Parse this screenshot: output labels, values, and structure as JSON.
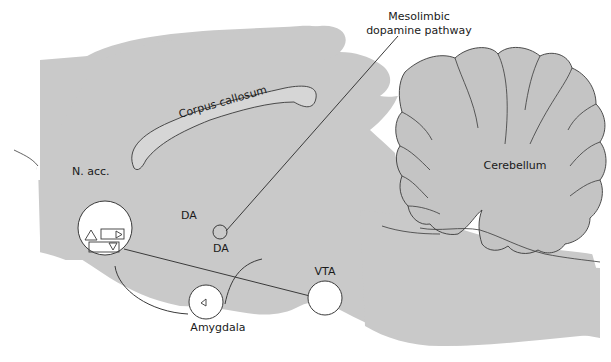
{
  "diagram": {
    "colors": {
      "brain_fill": "#c9c9c9",
      "cerebellum_fill": "#c4c4c4",
      "corpus_fill": "#d6d6d6",
      "line": "#3a3a3a",
      "nucleus_fill": "#ffffff",
      "background": "#ffffff"
    },
    "labels": {
      "pathway_line1": "Mesolimbic",
      "pathway_line2": "dopamine pathway",
      "corpus_callosum": "Corpus callosum",
      "cerebellum": "Cerebellum",
      "n_acc": "N. acc.",
      "da_upper": "DA",
      "da_lower": "DA",
      "vta": "VTA",
      "amygdala": "Amygdala"
    },
    "nodes": [
      {
        "id": "n_acc",
        "label": "N. acc.",
        "shape": "circle",
        "contains": [
          "triangle",
          "rect-with-right-triangle",
          "rect-with-down-triangle"
        ]
      },
      {
        "id": "vta",
        "label": "VTA",
        "shape": "circle"
      },
      {
        "id": "amygdala",
        "label": "Amygdala",
        "shape": "circle",
        "contains": [
          "small-triangle"
        ]
      },
      {
        "id": "junction",
        "label": "",
        "shape": "small-circle"
      }
    ],
    "edges": [
      {
        "from": "vta",
        "to": "n_acc",
        "label": "DA"
      },
      {
        "from": "junction",
        "to": "amygdala",
        "label": "DA"
      },
      {
        "from": "n_acc",
        "to": "amygdala",
        "label": ""
      },
      {
        "from": "junction",
        "to": "pathway_label",
        "label": "leader"
      }
    ]
  }
}
